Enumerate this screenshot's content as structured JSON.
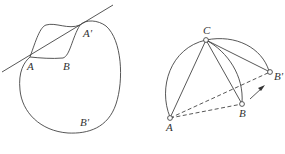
{
  "figure_left": {
    "labels": {
      "A": "A",
      "B": "B",
      "A_prime": "A'",
      "B_prime": "B'"
    },
    "caption": ""
  },
  "figure_right": {
    "labels": {
      "A": "A",
      "B": "B",
      "C": "C",
      "B_prime": "B'"
    },
    "caption": ""
  },
  "colors": {
    "stroke": "#444444",
    "background": "#ffffff"
  }
}
